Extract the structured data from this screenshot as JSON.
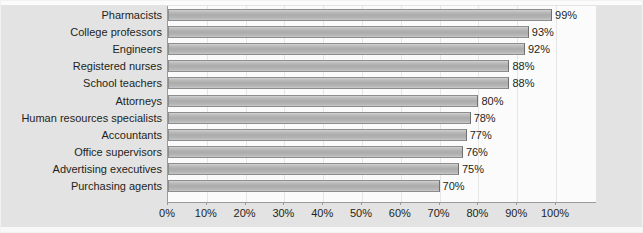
{
  "chart_data": {
    "type": "bar",
    "orientation": "horizontal",
    "title": "",
    "subtitle": "",
    "xlabel": "",
    "ylabel": "",
    "xlim": [
      0,
      110
    ],
    "xticks": [
      0,
      10,
      20,
      30,
      40,
      50,
      60,
      70,
      80,
      90,
      100
    ],
    "xtick_labels": [
      "0%",
      "10%",
      "20%",
      "30%",
      "40%",
      "50%",
      "60%",
      "70%",
      "80%",
      "90%",
      "100%"
    ],
    "grid": true,
    "legend": null,
    "value_suffix": "%",
    "categories": [
      "Pharmacists",
      "College professors",
      "Engineers",
      "Registered nurses",
      "School teachers",
      "Attorneys",
      "Human resources specialists",
      "Accountants",
      "Office supervisors",
      "Advertising executives",
      "Purchasing agents"
    ],
    "values": [
      99,
      93,
      92,
      88,
      88,
      80,
      78,
      77,
      76,
      75,
      70
    ],
    "value_labels": [
      "99%",
      "93%",
      "92%",
      "88%",
      "88%",
      "80%",
      "78%",
      "77%",
      "76%",
      "75%",
      "70%"
    ],
    "colors": {
      "bar_fill_light": "#d3d3d3",
      "bar_fill_mid": "#ababab",
      "bar_border": "#8d8d8d",
      "frame_background": "#e3e3e3",
      "plot_background": "#fbfbfb",
      "text": "#231f20",
      "axis": "#9a9a9a",
      "gridline": "#e6e6e6"
    }
  }
}
